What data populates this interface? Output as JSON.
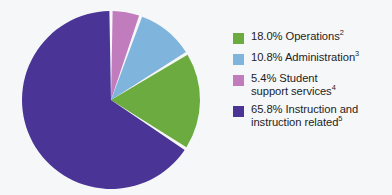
{
  "chart_data": {
    "type": "pie",
    "title": "",
    "subtitle": "",
    "xlabel": "",
    "ylabel": "",
    "legend_position": "right",
    "grid": false,
    "start_angle_deg": 0,
    "direction": "clockwise",
    "slice_gap": true,
    "categories": [
      "Student support services",
      "Administration",
      "Operations",
      "Instruction and instruction related"
    ],
    "values": [
      5.4,
      10.8,
      18.0,
      65.8
    ],
    "value_unit": "%",
    "colors": [
      "#c17cbe",
      "#7fb4dd",
      "#6bab3f",
      "#4a3596"
    ],
    "slices": [
      {
        "label": "Student support services",
        "value": 5.4,
        "display_value": "5.4%",
        "color": "#c17cbe",
        "footnote_marker": "4"
      },
      {
        "label": "Administration",
        "value": 10.8,
        "display_value": "10.8%",
        "color": "#7fb4dd",
        "footnote_marker": "3"
      },
      {
        "label": "Operations",
        "value": 18.0,
        "display_value": "18.0%",
        "color": "#6bab3f",
        "footnote_marker": "2"
      },
      {
        "label": "Instruction and instruction related",
        "value": 65.8,
        "display_value": "65.8%",
        "color": "#4a3596",
        "footnote_marker": "5"
      }
    ]
  },
  "legend": {
    "entries": [
      {
        "swatch_color": "#6bab3f",
        "percent": "18.0%",
        "name": "Operations",
        "line1": "18.0% Operations",
        "line2": "",
        "footnote": "2"
      },
      {
        "swatch_color": "#7fb4dd",
        "percent": "10.8%",
        "name": "Administration",
        "line1": "10.8% Administration",
        "line2": "",
        "footnote": "3"
      },
      {
        "swatch_color": "#c17cbe",
        "percent": "5.4%",
        "name": "Student support services",
        "line1": "5.4% Student",
        "line2": "support services",
        "footnote": "4"
      },
      {
        "swatch_color": "#4a3596",
        "percent": "65.8%",
        "name": "Instruction and instruction related",
        "line1": "65.8% Instruction and",
        "line2": "instruction related",
        "footnote": "5"
      }
    ]
  },
  "style": {
    "background": "#f6f7f9",
    "separator_color": "#ffffff",
    "text_color": "#1d1d1f"
  }
}
